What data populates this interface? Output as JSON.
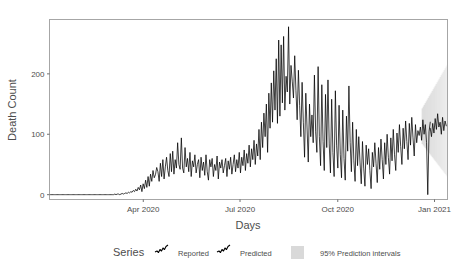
{
  "chart_data": {
    "type": "line",
    "title": "",
    "xlabel": "Days",
    "ylabel": "Death Count",
    "ylim": [
      -8,
      290
    ],
    "yticks": [
      0,
      100,
      200
    ],
    "ytick_labels": [
      "0",
      "100",
      "200"
    ],
    "xticks": [
      "Apr 2020",
      "Jul 2020",
      "Oct 2020",
      "Jan 2021"
    ],
    "xtick_positions_frac": [
      0.2356,
      0.4787,
      0.7243,
      0.9674
    ],
    "grid": false,
    "legend_position": "bottom",
    "legend_title": "Series",
    "x_start_label": "Feb 2020",
    "x_end_label": "Jan 2021",
    "series": [
      {
        "name": "Reported",
        "color": "#000000",
        "n_points": 310,
        "values": [
          0,
          0,
          0,
          0,
          0,
          0,
          0,
          0,
          0,
          0,
          0,
          0,
          0,
          0,
          0,
          0,
          0,
          0,
          0,
          0,
          0,
          0,
          0,
          0,
          0,
          0,
          0,
          0,
          0,
          0,
          0,
          0,
          0,
          0,
          0,
          0,
          0,
          0,
          0,
          0,
          0,
          0,
          0,
          0,
          0,
          0,
          0,
          0,
          0,
          0,
          0,
          0,
          0,
          1,
          0,
          1,
          1,
          0,
          1,
          2,
          1,
          2,
          3,
          2,
          4,
          3,
          5,
          4,
          7,
          5,
          9,
          6,
          12,
          8,
          16,
          5,
          18,
          10,
          24,
          12,
          30,
          14,
          34,
          22,
          40,
          28,
          33,
          45,
          38,
          22,
          52,
          30,
          58,
          26,
          46,
          62,
          40,
          30,
          68,
          38,
          72,
          34,
          58,
          44,
          86,
          50,
          42,
          94,
          44,
          36,
          78,
          46,
          60,
          38,
          70,
          30,
          56,
          46,
          66,
          36,
          50,
          58,
          28,
          62,
          40,
          54,
          32,
          66,
          38,
          24,
          58,
          46,
          60,
          30,
          50,
          40,
          64,
          26,
          54,
          44,
          58,
          36,
          48,
          60,
          30,
          56,
          42,
          62,
          34,
          50,
          66,
          38,
          58,
          44,
          70,
          36,
          62,
          48,
          74,
          40,
          68,
          52,
          82,
          46,
          76,
          58,
          90,
          50,
          84,
          64,
          108,
          58,
          120,
          78,
          135,
          96,
          150,
          70,
          168,
          110,
          185,
          120,
          205,
          140,
          225,
          118,
          256,
          130,
          248,
          152,
          262,
          140,
          196,
          170,
          278,
          150,
          214,
          188,
          160,
          230,
          172,
          124,
          206,
          148,
          96,
          186,
          120,
          62,
          168,
          112,
          54,
          150,
          96,
          132,
          86,
          198,
          104,
          70,
          212,
          96,
          48,
          182,
          88,
          40,
          166,
          78,
          190,
          84,
          36,
          158,
          70,
          30,
          172,
          82,
          44,
          148,
          66,
          28,
          140,
          60,
          24,
          130,
          72,
          180,
          86,
          38,
          120,
          56,
          22,
          108,
          48,
          96,
          54,
          18,
          88,
          44,
          14,
          82,
          50,
          76,
          40,
          10,
          70,
          46,
          86,
          52,
          20,
          78,
          42,
          92,
          58,
          26,
          86,
          50,
          100,
          62,
          34,
          94,
          56,
          108,
          66,
          40,
          102,
          70,
          116,
          80,
          50,
          110,
          76,
          122,
          88,
          58,
          118,
          82,
          128,
          94,
          64,
          116,
          86,
          106,
          98,
          112,
          90,
          124,
          100,
          116,
          86,
          0,
          104,
          120
        ]
      },
      {
        "name": "Predicted",
        "color": "#000000",
        "n_points": 14,
        "values": [
          110,
          96,
          118,
          102,
          126,
          108,
          134,
          112,
          120,
          100,
          128,
          106,
          122,
          114
        ]
      }
    ],
    "prediction_interval": {
      "label": "95% Prediction intervals",
      "color": "#d9d9d9",
      "start_frac": 0.935,
      "end_frac": 1.0,
      "lower_at_start": 86,
      "upper_at_start": 140,
      "lower_at_end": 30,
      "upper_at_end": 215
    }
  },
  "legend": {
    "title": "Series",
    "items": [
      {
        "label": "Reported",
        "glyph": "line-glyph"
      },
      {
        "label": "Predicted",
        "glyph": "line-glyph"
      }
    ],
    "interval_label": "95% Prediction intervals",
    "interval_swatch_color": "#d9d9d9"
  },
  "axes": {
    "y_title": "Death Count",
    "x_title": "Days",
    "y_ticks": [
      "0",
      "100",
      "200"
    ],
    "x_ticks": [
      "Apr 2020",
      "Jul 2020",
      "Oct 2020",
      "Jan 2021"
    ]
  },
  "colors": {
    "panel_border": "#a6a6a6",
    "line": "#000000",
    "text": "#4d4d4d",
    "background": "#ffffff",
    "interval": "#d9d9d9"
  }
}
